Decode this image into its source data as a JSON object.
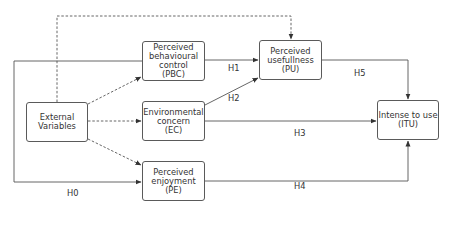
{
  "diagram": {
    "nodes": [
      {
        "id": "EV",
        "label": "External\nVariables",
        "x": 26,
        "y": 102,
        "w": 62,
        "h": 40
      },
      {
        "id": "PBC",
        "label": "Perceived\nbehavioural\ncontrol\n(PBC)",
        "x": 142,
        "y": 41,
        "w": 63,
        "h": 40
      },
      {
        "id": "EC",
        "label": "Environmental\nconcern\n(EC)",
        "x": 142,
        "y": 101,
        "w": 63,
        "h": 40
      },
      {
        "id": "PE",
        "label": "Perceived\nenjoyment\n(PE)",
        "x": 142,
        "y": 161,
        "w": 63,
        "h": 40
      },
      {
        "id": "PU",
        "label": "Perceived\nusefullness\n(PU)",
        "x": 259,
        "y": 40,
        "w": 63,
        "h": 40
      },
      {
        "id": "ITU",
        "label": "Intense to use\n(ITU)",
        "x": 377,
        "y": 100,
        "w": 62,
        "h": 40
      }
    ],
    "edge_labels": [
      {
        "id": "H0",
        "text": "H0",
        "x": 67,
        "y": 193
      },
      {
        "id": "H1",
        "text": "H1",
        "x": 228,
        "y": 68
      },
      {
        "id": "H2",
        "text": "H2",
        "x": 228,
        "y": 98
      },
      {
        "id": "H3",
        "text": "H3",
        "x": 294,
        "y": 133
      },
      {
        "id": "H4",
        "text": "H4",
        "x": 294,
        "y": 186
      },
      {
        "id": "H5",
        "text": "H5",
        "x": 354,
        "y": 73
      }
    ],
    "edges": [
      {
        "from": "EV",
        "to": "PBC",
        "style": "dashed"
      },
      {
        "from": "EV",
        "to": "EC",
        "style": "dashed"
      },
      {
        "from": "EV",
        "to": "PE",
        "style": "dashed"
      },
      {
        "from": "EV",
        "to": "PU",
        "style": "dashed"
      },
      {
        "from": "PBC",
        "to": "PU",
        "style": "solid",
        "label": "H1"
      },
      {
        "from": "EC",
        "to": "PU",
        "style": "solid",
        "label": "H2"
      },
      {
        "from": "EC",
        "to": "ITU",
        "style": "solid",
        "label": "H3"
      },
      {
        "from": "PE",
        "to": "ITU",
        "style": "solid",
        "label": "H4"
      },
      {
        "from": "PU",
        "to": "ITU",
        "style": "solid",
        "label": "H5"
      },
      {
        "from": "PBC",
        "to": "PE",
        "style": "solid",
        "label": "H0"
      }
    ]
  }
}
